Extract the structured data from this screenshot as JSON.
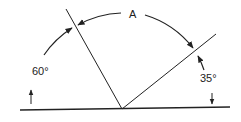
{
  "diagram": {
    "type": "angle-geometry",
    "labels": {
      "arc_label": "A",
      "left_angle": "60°",
      "right_angle": "35°"
    },
    "angles": {
      "left_deg": 60,
      "right_deg": 35,
      "unknown": "A"
    },
    "colors": {
      "stroke": "#222222",
      "background": "#ffffff"
    }
  }
}
